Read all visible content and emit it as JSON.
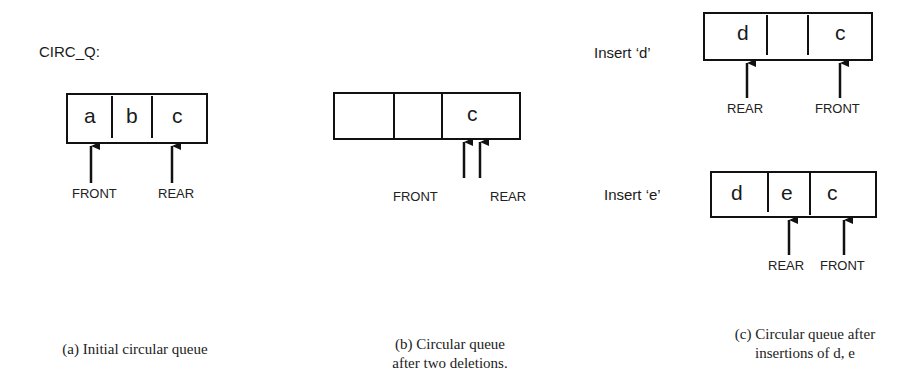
{
  "title": "CIRC_Q:",
  "panels": [
    {
      "id": "a",
      "cells": [
        "a",
        "b",
        "c"
      ],
      "pointers": [
        {
          "name": "FRONT",
          "cell_index": 0
        },
        {
          "name": "REAR",
          "cell_index": 2
        }
      ],
      "caption_lines": [
        "(a) Initial circular queue"
      ]
    },
    {
      "id": "b",
      "cells": [
        "",
        "",
        "c"
      ],
      "pointers": [
        {
          "name": "FRONT",
          "cell_index": 2
        },
        {
          "name": "REAR",
          "cell_index": 2
        }
      ],
      "caption_lines": [
        "(b) Circular queue",
        "after two deletions."
      ]
    },
    {
      "id": "c1",
      "step_label": "Insert ‘d’",
      "cells": [
        "d",
        "",
        "c"
      ],
      "pointers": [
        {
          "name": "REAR",
          "cell_index": 0
        },
        {
          "name": "FRONT",
          "cell_index": 2
        }
      ]
    },
    {
      "id": "c2",
      "step_label": "Insert ‘e’",
      "cells": [
        "d",
        "e",
        "c"
      ],
      "pointers": [
        {
          "name": "REAR",
          "cell_index": 1
        },
        {
          "name": "FRONT",
          "cell_index": 2
        }
      ],
      "caption_lines": [
        "(c) Circular queue after",
        "insertions of d, e"
      ]
    }
  ]
}
